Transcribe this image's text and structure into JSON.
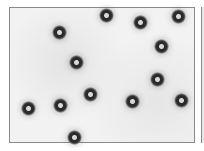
{
  "image": {
    "description": "Grayscale micrograph of dark ring-shaped particles on a light speckled background",
    "particles": [
      {
        "x": 59,
        "y": 32
      },
      {
        "x": 76,
        "y": 62
      },
      {
        "x": 106,
        "y": 15
      },
      {
        "x": 140,
        "y": 22
      },
      {
        "x": 178,
        "y": 16
      },
      {
        "x": 161,
        "y": 46
      },
      {
        "x": 157,
        "y": 79
      },
      {
        "x": 132,
        "y": 101
      },
      {
        "x": 181,
        "y": 100
      },
      {
        "x": 90,
        "y": 94
      },
      {
        "x": 60,
        "y": 105
      },
      {
        "x": 28,
        "y": 108
      },
      {
        "x": 74,
        "y": 137
      }
    ]
  }
}
